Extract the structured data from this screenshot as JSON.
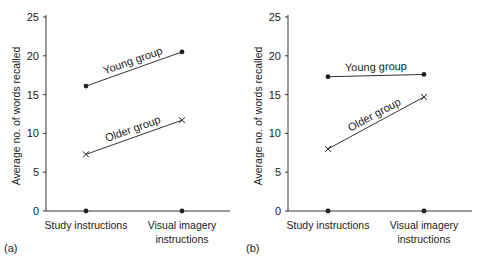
{
  "chart_data": [
    {
      "type": "line",
      "panel_label": "(a)",
      "categories": [
        "Study instructions",
        "Visual imagery instructions"
      ],
      "category_lines": [
        [
          "Study instructions"
        ],
        [
          "Visual imagery",
          "instructions"
        ]
      ],
      "series": [
        {
          "name": "Young group",
          "marker": "dot",
          "values": [
            16.1,
            20.5
          ]
        },
        {
          "name": "Older group",
          "marker": "x",
          "values": [
            7.3,
            11.7
          ]
        }
      ],
      "xlabel": "",
      "ylabel": "Average no. of words recalled",
      "ylim": [
        0,
        25
      ],
      "yticks": [
        0,
        5,
        10,
        15,
        20,
        25
      ],
      "grid": false
    },
    {
      "type": "line",
      "panel_label": "(b)",
      "categories": [
        "Study instructions",
        "Visual imagery instructions"
      ],
      "category_lines": [
        [
          "Study instructions"
        ],
        [
          "Visual imagery",
          "instructions"
        ]
      ],
      "series": [
        {
          "name": "Young group",
          "marker": "dot",
          "values": [
            17.3,
            17.6
          ]
        },
        {
          "name": "Older group",
          "marker": "x",
          "values": [
            8.0,
            14.7
          ]
        }
      ],
      "xlabel": "",
      "ylabel": "Average no. of words recalled",
      "ylim": [
        0,
        25
      ],
      "yticks": [
        0,
        5,
        10,
        15,
        20,
        25
      ],
      "grid": false
    }
  ]
}
